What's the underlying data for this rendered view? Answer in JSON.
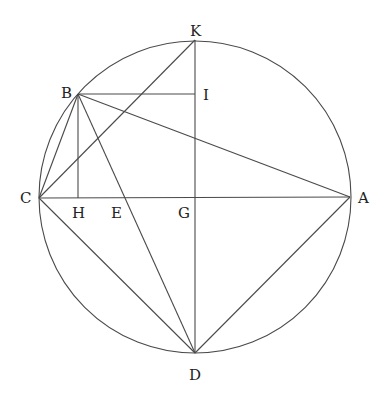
{
  "diagram": {
    "type": "geometry-figure",
    "circle": {
      "center": "G",
      "cx": 195,
      "cy": 197,
      "r": 156
    },
    "points": [
      {
        "id": "K",
        "label": "K",
        "x": 195,
        "y": 40,
        "lx": 190,
        "ly": 36
      },
      {
        "id": "B",
        "label": "B",
        "x": 78,
        "y": 94,
        "lx": 61,
        "ly": 98
      },
      {
        "id": "I",
        "label": "I",
        "x": 195,
        "y": 94,
        "lx": 203,
        "ly": 100
      },
      {
        "id": "C",
        "label": "C",
        "x": 39,
        "y": 198,
        "lx": 20,
        "ly": 203
      },
      {
        "id": "H",
        "label": "H",
        "x": 78,
        "y": 198,
        "lx": 72,
        "ly": 218
      },
      {
        "id": "E",
        "label": "E",
        "x": 123,
        "y": 198,
        "lx": 111,
        "ly": 218
      },
      {
        "id": "G",
        "label": "G",
        "x": 195,
        "y": 198,
        "lx": 178,
        "ly": 218
      },
      {
        "id": "A",
        "label": "A",
        "x": 350,
        "y": 197,
        "lx": 358,
        "ly": 203
      },
      {
        "id": "D",
        "label": "D",
        "x": 195,
        "y": 353,
        "lx": 189,
        "ly": 380
      }
    ],
    "segments": [
      [
        "C",
        "A"
      ],
      [
        "K",
        "D"
      ],
      [
        "B",
        "I"
      ],
      [
        "B",
        "H"
      ],
      [
        "C",
        "K"
      ],
      [
        "C",
        "B"
      ],
      [
        "B",
        "A"
      ],
      [
        "B",
        "D"
      ],
      [
        "C",
        "D"
      ],
      [
        "A",
        "D"
      ]
    ],
    "color": "#4a4a4a"
  }
}
